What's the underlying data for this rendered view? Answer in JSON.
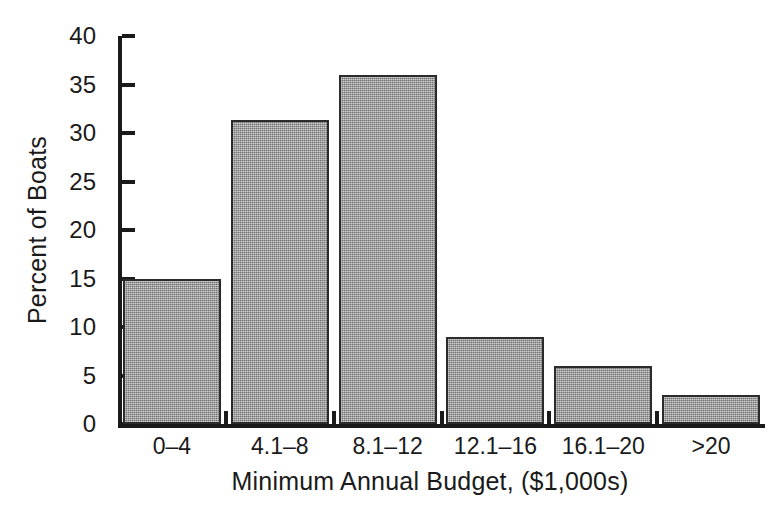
{
  "chart_data": {
    "type": "bar",
    "title": "",
    "xlabel": "Minimum Annual Budget, ($1,000s)",
    "ylabel": "Percent of Boats",
    "categories": [
      "0–4",
      "4.1–8",
      "8.1–12",
      "12.1–16",
      "16.1–20",
      ">20"
    ],
    "values": [
      15,
      31.3,
      36,
      9,
      6,
      3
    ],
    "ylim": [
      0,
      40
    ],
    "yticks": [
      0,
      5,
      10,
      15,
      20,
      25,
      30,
      35,
      40
    ],
    "ytick_labels": [
      "0",
      "5",
      "10",
      "15",
      "20",
      "25",
      "30",
      "35",
      "40"
    ],
    "grid": false,
    "legend": false,
    "bar_color": "#8d8d8d",
    "bar_edge_color": "#2b2b2b",
    "axis_color": "#1a1a1a",
    "background_color": "#ffffff"
  }
}
